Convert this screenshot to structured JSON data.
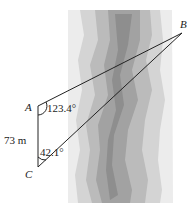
{
  "figure": {
    "points": {
      "A": {
        "label": "A",
        "x": 38,
        "y": 106
      },
      "B": {
        "label": "B",
        "x": 182,
        "y": 33
      },
      "C": {
        "label": "C",
        "x": 38,
        "y": 167
      }
    },
    "side_AC_label": "73 m",
    "angle_A_label": "123.4°",
    "angle_C_label": "42.1°",
    "river_colors": [
      "#ededed",
      "#d6d6d6",
      "#bdbdbd",
      "#a4a4a4",
      "#8c8c8c"
    ]
  }
}
